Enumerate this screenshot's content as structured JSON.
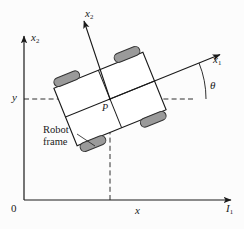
{
  "figure": {
    "background_color": "#fcfcfc",
    "width": 244,
    "height": 229
  },
  "colors": {
    "stroke": "#1a1a1a",
    "wheel_fill": "#9a9a9a",
    "wheel_stroke": "#333333",
    "chassis_fill": "#ffffff",
    "dashed": "#1a1a1a",
    "text": "#1a1a1a"
  },
  "labels": {
    "global_vertical_axis": "x",
    "global_vertical_axis_sub": "2",
    "global_horizontal_axis": "I",
    "global_horizontal_axis_sub": "1",
    "origin": "0",
    "tick_x": "x",
    "tick_y": "y",
    "body_axis_forward": "x",
    "body_axis_forward_sub": "1",
    "body_axis_lateral": "x",
    "body_axis_lateral_sub": "2",
    "heading_angle": "θ",
    "reference_point": "P",
    "robot_frame_line1": "Robot",
    "robot_frame_line2": "frame"
  },
  "geometry": {
    "origin_px": {
      "x": 24,
      "y": 200
    },
    "reference_point_px": {
      "x": 110,
      "y": 99
    },
    "heading_angle_deg": 22,
    "chassis_rotation_deg": -22,
    "chassis_size_px": {
      "w": 96,
      "h": 62
    },
    "wheel_count": 4,
    "wheel_size_px": {
      "w": 27,
      "h": 9
    },
    "dashed_lines": [
      "y-horizontal-to-P",
      "x-vertical-to-P",
      "theta-reference-horizontal"
    ]
  },
  "icon_names": {
    "arrowhead": "arrowhead-icon",
    "wheel": "wheel-icon",
    "angle_arc": "angle-arc-icon"
  }
}
